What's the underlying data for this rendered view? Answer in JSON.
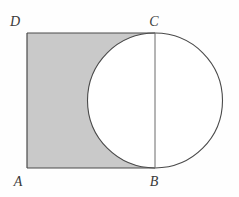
{
  "figure": {
    "background_color": "#fefefe",
    "labels": {
      "a": "A",
      "b": "B",
      "c": "C",
      "d": "D"
    },
    "colors": {
      "shade_fill": "#c9c9c9",
      "stroke": "#4a4a4a",
      "circle_fill": "#ffffff",
      "label_color": "#3a3a3a"
    },
    "geometry": {
      "rectangle": {
        "label": "ABCD",
        "a_point": "27,168",
        "b_point": "155,168",
        "c_point": "155,33",
        "d_point": "27,33",
        "width": "128",
        "height": "135"
      },
      "circle": {
        "center": "155,100.5",
        "radius": "67.5",
        "chord_label": "BC"
      },
      "shaded_region_description": "Rectangle ABCD minus the left portion of the circle"
    }
  }
}
